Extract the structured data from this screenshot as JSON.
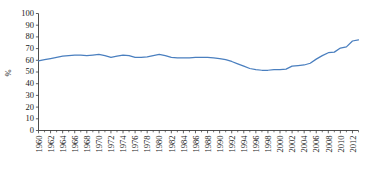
{
  "chart_data": {
    "type": "line",
    "title": "",
    "xlabel": "",
    "ylabel": "%",
    "ylim": [
      0,
      100
    ],
    "ytick_step": 10,
    "yticks": [
      0,
      10,
      20,
      30,
      40,
      50,
      60,
      70,
      80,
      90,
      100
    ],
    "xlim": [
      1960,
      2013
    ],
    "xticks": [
      1960,
      1962,
      1964,
      1966,
      1968,
      1970,
      1972,
      1974,
      1976,
      1978,
      1980,
      1982,
      1984,
      1986,
      1988,
      1990,
      1992,
      1994,
      1996,
      1998,
      2000,
      2002,
      2004,
      2006,
      2008,
      2010,
      2012
    ],
    "xtick_labels": [
      "1960",
      "1962",
      "1964",
      "1966",
      "1968",
      "1970",
      "1972",
      "1974",
      "1976",
      "1978",
      "1980",
      "1982",
      "1984",
      "1986",
      "1988",
      "1990",
      "1992",
      "1994",
      "1996",
      "1998",
      "2000",
      "2002",
      "2004",
      "2006",
      "2008",
      "2010",
      "2012"
    ],
    "grid": false,
    "legend": null,
    "series": [
      {
        "name": "series-1",
        "color": "#4a7fbf",
        "x": [
          1960,
          1961,
          1962,
          1963,
          1964,
          1965,
          1966,
          1967,
          1968,
          1969,
          1970,
          1971,
          1972,
          1973,
          1974,
          1975,
          1976,
          1977,
          1978,
          1979,
          1980,
          1981,
          1982,
          1983,
          1984,
          1985,
          1986,
          1987,
          1988,
          1989,
          1990,
          1991,
          1992,
          1993,
          1994,
          1995,
          1996,
          1997,
          1998,
          1999,
          2000,
          2001,
          2002,
          2003,
          2004,
          2005,
          2006,
          2007,
          2008,
          2009,
          2010,
          2011,
          2012,
          2013
        ],
        "values": [
          59.5,
          60.5,
          61.5,
          62.5,
          63.5,
          64.0,
          64.5,
          64.5,
          64.0,
          64.5,
          65.0,
          64.0,
          62.5,
          63.5,
          64.5,
          64.0,
          62.5,
          62.5,
          63.0,
          64.0,
          65.0,
          64.0,
          62.5,
          62.0,
          62.0,
          62.0,
          62.5,
          62.5,
          62.5,
          62.0,
          61.5,
          60.5,
          59.0,
          57.0,
          55.0,
          53.0,
          52.0,
          51.5,
          51.5,
          52.0,
          52.0,
          52.5,
          55.0,
          55.5,
          56.0,
          57.5,
          61.0,
          64.0,
          66.5,
          67.0,
          70.5,
          71.5,
          76.5,
          77.5
        ]
      }
    ]
  },
  "axis": {
    "y_label": "%"
  }
}
